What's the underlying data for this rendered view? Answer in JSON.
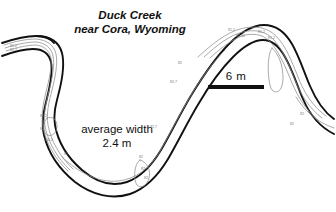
{
  "figure": {
    "kind": "stream-planform-map",
    "background_color": "#ffffff",
    "ink_color": "#111111",
    "historic_line_color": "#8c8c8c"
  },
  "title": {
    "line1": "Duck Creek",
    "line2": "near Cora, Wyoming"
  },
  "annotation": {
    "line1": "average width",
    "line2": "2.4 m"
  },
  "scale": {
    "label": "6 m",
    "bar_length_px": 56,
    "represents_meters": 6
  },
  "survey_labels": [
    {
      "text": "81-2",
      "x": 10,
      "y": 44
    },
    {
      "text": "81-2",
      "x": 10,
      "y": 48
    },
    {
      "text": "81-2",
      "x": 40,
      "y": 114
    },
    {
      "text": "82",
      "x": 40,
      "y": 127
    },
    {
      "text": "100-2",
      "x": 44,
      "y": 138
    },
    {
      "text": "82",
      "x": 64,
      "y": 152
    },
    {
      "text": "82",
      "x": 139,
      "y": 155
    },
    {
      "text": "82",
      "x": 141,
      "y": 167
    },
    {
      "text": "82",
      "x": 144,
      "y": 176
    },
    {
      "text": "82-7",
      "x": 150,
      "y": 125
    },
    {
      "text": "82-7",
      "x": 170,
      "y": 80
    },
    {
      "text": "82",
      "x": 178,
      "y": 61
    },
    {
      "text": "81-2",
      "x": 228,
      "y": 28
    },
    {
      "text": "82-10",
      "x": 236,
      "y": 34
    },
    {
      "text": "81-2",
      "x": 258,
      "y": 30
    },
    {
      "text": "81-2",
      "x": 268,
      "y": 36
    },
    {
      "text": "82",
      "x": 300,
      "y": 112
    },
    {
      "text": "82",
      "x": 290,
      "y": 122
    }
  ]
}
